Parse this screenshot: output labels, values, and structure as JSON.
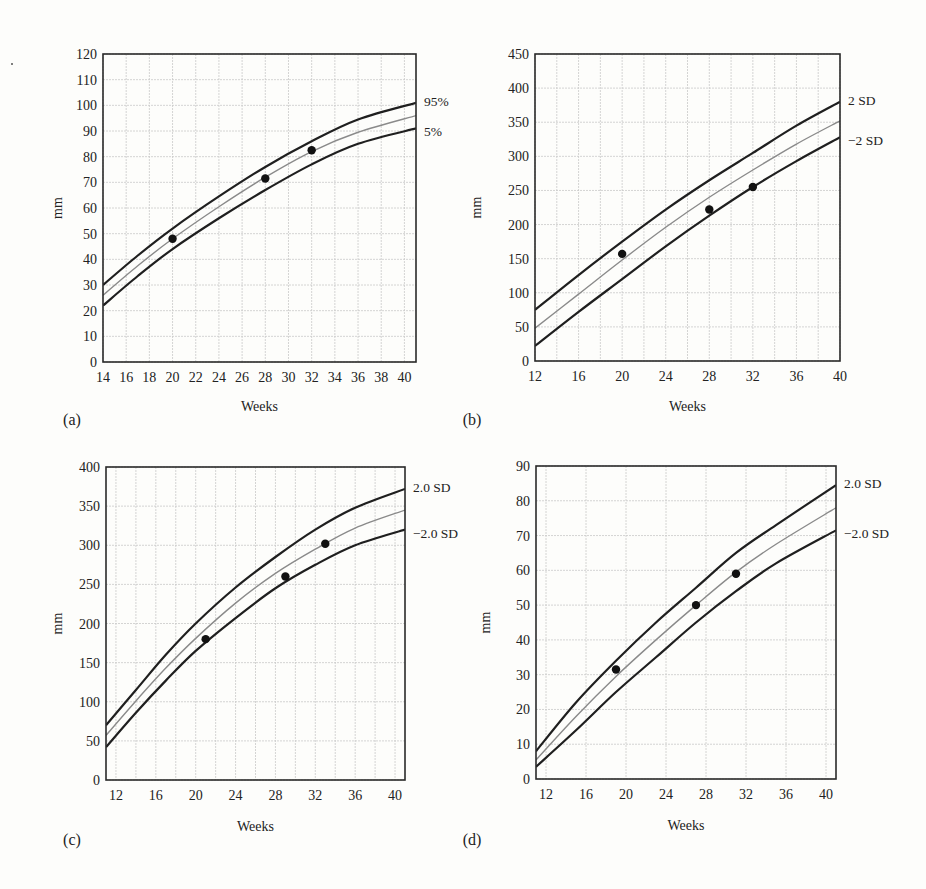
{
  "chart_data": [
    {
      "panel": "(a)",
      "type": "line",
      "xlabel": "Weeks",
      "ylabel": "mm",
      "xlim": [
        14,
        41
      ],
      "ylim": [
        0,
        120
      ],
      "xticks": [
        14,
        16,
        18,
        20,
        22,
        24,
        26,
        28,
        30,
        32,
        34,
        36,
        38,
        40
      ],
      "yticks": [
        0,
        10,
        20,
        30,
        40,
        50,
        60,
        70,
        80,
        90,
        100,
        110,
        120
      ],
      "xgrid": [
        14,
        16,
        18,
        20,
        22,
        24,
        26,
        28,
        30,
        32,
        34,
        36,
        38,
        40
      ],
      "grid": true,
      "series": [
        {
          "name": "95%",
          "style": "outer",
          "x": [
            14,
            17,
            20,
            24,
            28,
            32,
            36,
            41
          ],
          "y": [
            30,
            41.5,
            52,
            64.5,
            76,
            86,
            94.5,
            101
          ]
        },
        {
          "name": "median",
          "style": "mid",
          "x": [
            14,
            17,
            20,
            24,
            28,
            32,
            36,
            41
          ],
          "y": [
            26,
            37.5,
            48,
            60.5,
            72,
            82,
            89.5,
            96
          ]
        },
        {
          "name": "5%",
          "style": "outer",
          "x": [
            14,
            17,
            20,
            24,
            28,
            32,
            36,
            41
          ],
          "y": [
            22,
            33.5,
            44,
            56,
            67,
            77,
            85,
            91
          ]
        },
        {
          "name": "measurements",
          "style": "points",
          "x": [
            20,
            28,
            32
          ],
          "y": [
            48,
            71.5,
            82.5
          ]
        }
      ],
      "curve_labels": [
        {
          "text": "95%",
          "y": 101
        },
        {
          "text": "5%",
          "y": 91
        }
      ]
    },
    {
      "panel": "(b)",
      "type": "line",
      "xlabel": "Weeks",
      "ylabel": "mm",
      "xlim": [
        12,
        40
      ],
      "ylim": [
        0,
        450
      ],
      "xticks": [
        12,
        16,
        20,
        24,
        28,
        32,
        36,
        40
      ],
      "yticks": [
        0,
        50,
        100,
        150,
        200,
        250,
        300,
        350,
        400,
        450
      ],
      "xgrid": [
        12,
        14,
        16,
        18,
        20,
        22,
        24,
        26,
        28,
        30,
        32,
        34,
        36,
        38,
        40
      ],
      "grid": true,
      "series": [
        {
          "name": "2 SD",
          "style": "outer",
          "x": [
            12,
            16,
            20,
            24,
            28,
            32,
            36,
            40
          ],
          "y": [
            75,
            126,
            175,
            222,
            265,
            305,
            345,
            380
          ]
        },
        {
          "name": "mean",
          "style": "mid",
          "x": [
            12,
            16,
            20,
            24,
            28,
            32,
            36,
            40
          ],
          "y": [
            48,
            98,
            148,
            196,
            240,
            280,
            318,
            352
          ]
        },
        {
          "name": "-2 SD",
          "style": "outer",
          "x": [
            12,
            16,
            20,
            24,
            28,
            32,
            36,
            40
          ],
          "y": [
            22,
            72,
            120,
            168,
            213,
            255,
            293,
            328
          ]
        },
        {
          "name": "measurements",
          "style": "points",
          "x": [
            20,
            28,
            32
          ],
          "y": [
            157,
            222,
            255
          ]
        }
      ],
      "curve_labels": [
        {
          "text": "2 SD",
          "y": 380
        },
        {
          "text": "−2 SD",
          "y": 328
        }
      ]
    },
    {
      "panel": "(c)",
      "type": "line",
      "xlabel": "Weeks",
      "ylabel": "mm",
      "xlim": [
        11,
        41
      ],
      "ylim": [
        0,
        400
      ],
      "xticks": [
        12,
        16,
        20,
        24,
        28,
        32,
        36,
        40
      ],
      "yticks": [
        0,
        50,
        100,
        150,
        200,
        250,
        300,
        350,
        400
      ],
      "xgrid": [
        12,
        14,
        16,
        18,
        20,
        22,
        24,
        26,
        28,
        30,
        32,
        34,
        36,
        38,
        40
      ],
      "grid": true,
      "series": [
        {
          "name": "2.0 SD",
          "style": "outer",
          "x": [
            11,
            14,
            17,
            20,
            24,
            28,
            32,
            36,
            41
          ],
          "y": [
            70,
            115,
            160,
            200,
            246,
            285,
            320,
            348,
            372
          ]
        },
        {
          "name": "mean",
          "style": "mid",
          "x": [
            11,
            14,
            17,
            20,
            24,
            28,
            32,
            36,
            41
          ],
          "y": [
            57,
            101,
            143,
            181,
            226,
            264,
            295,
            322,
            345
          ]
        },
        {
          "name": "-2.0 SD",
          "style": "outer",
          "x": [
            11,
            14,
            17,
            20,
            24,
            28,
            32,
            36,
            41
          ],
          "y": [
            42,
            86,
            127,
            165,
            207,
            245,
            275,
            300,
            320
          ]
        },
        {
          "name": "measurements",
          "style": "points",
          "x": [
            21,
            29,
            33
          ],
          "y": [
            180,
            260,
            302
          ]
        }
      ],
      "curve_labels": [
        {
          "text": "2.0 SD",
          "y": 372
        },
        {
          "text": "−2.0 SD",
          "y": 320
        }
      ]
    },
    {
      "panel": "(d)",
      "type": "line",
      "xlabel": "Weeks",
      "ylabel": "mm",
      "xlim": [
        11,
        41
      ],
      "ylim": [
        0,
        90
      ],
      "xticks": [
        12,
        16,
        20,
        24,
        28,
        32,
        36,
        40
      ],
      "yticks": [
        0,
        10,
        20,
        30,
        40,
        50,
        60,
        70,
        80,
        90
      ],
      "xgrid": [
        12,
        16,
        20,
        24,
        28,
        32,
        36,
        40
      ],
      "grid": true,
      "series": [
        {
          "name": "2.0 SD",
          "style": "outer",
          "x": [
            11,
            15,
            19,
            23,
            27,
            31,
            35,
            41
          ],
          "y": [
            8,
            22,
            34,
            45,
            55,
            65,
            73,
            84.5
          ]
        },
        {
          "name": "mean",
          "style": "mid",
          "x": [
            11,
            15,
            19,
            23,
            27,
            31,
            35,
            41
          ],
          "y": [
            5.5,
            18,
            29.5,
            40,
            50,
            59.5,
            67.5,
            78
          ]
        },
        {
          "name": "-2.0 SD",
          "style": "outer",
          "x": [
            11,
            15,
            19,
            23,
            27,
            31,
            35,
            41
          ],
          "y": [
            3.5,
            14,
            25,
            35,
            45,
            54,
            62,
            71.5
          ]
        },
        {
          "name": "measurements",
          "style": "points",
          "x": [
            19,
            27,
            31
          ],
          "y": [
            31.5,
            50,
            59
          ]
        }
      ],
      "curve_labels": [
        {
          "text": "2.0 SD",
          "y": 84.5
        },
        {
          "text": "−2.0 SD",
          "y": 71.5
        }
      ]
    }
  ],
  "layout": [
    {
      "left": 103,
      "top": 54,
      "right": 416,
      "bottom": 362,
      "panel_label_x": 72,
      "panel_label_y": 425,
      "xlabel_y": 411,
      "ylabel_x": 62
    },
    {
      "left": 535,
      "top": 54,
      "right": 840,
      "bottom": 361,
      "panel_label_x": 472,
      "panel_label_y": 425,
      "xlabel_y": 411,
      "ylabel_x": 481
    },
    {
      "left": 106,
      "top": 467,
      "right": 405,
      "bottom": 780,
      "panel_label_x": 72,
      "panel_label_y": 845,
      "xlabel_y": 831,
      "ylabel_x": 62
    },
    {
      "left": 536,
      "top": 466,
      "right": 836,
      "bottom": 779,
      "panel_label_x": 472,
      "panel_label_y": 845,
      "xlabel_y": 830,
      "ylabel_x": 490
    }
  ],
  "colors": {
    "frame": "#2a2a2a",
    "outer_curve": "#1f1f1f",
    "mid_curve": "#8a8a8a",
    "grid": "#c9c9c9",
    "point": "#111111"
  }
}
